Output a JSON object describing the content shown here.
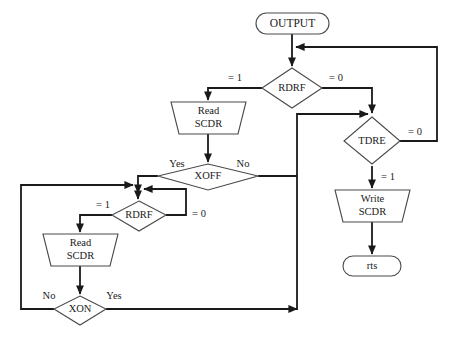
{
  "diagram": {
    "title": "OUTPUT",
    "type": "flowchart",
    "canvas": {
      "width": 452,
      "height": 341
    },
    "colors": {
      "background": "#ffffff",
      "shape_stroke": "#4a4a4a",
      "edge_stroke": "#1a1a1a",
      "text": "#1a1a1a"
    }
  },
  "nodes": {
    "output_terminal": {
      "label": "OUTPUT",
      "shape": "stadium"
    },
    "rdrf_top": {
      "label": "RDRF",
      "shape": "diamond"
    },
    "read_scdr_top": {
      "label_line1": "Read",
      "label_line2": "SCDR",
      "shape": "trapezoid"
    },
    "xoff": {
      "label": "XOFF",
      "shape": "diamond"
    },
    "rdrf_bottom": {
      "label": "RDRF",
      "shape": "diamond"
    },
    "read_scdr_bottom": {
      "label_line1": "Read",
      "label_line2": "SCDR",
      "shape": "trapezoid"
    },
    "xon": {
      "label": "XON",
      "shape": "diamond"
    },
    "tdre": {
      "label": "TDRE",
      "shape": "diamond"
    },
    "write_scdr": {
      "label_line1": "Write",
      "label_line2": "SCDR",
      "shape": "trapezoid"
    },
    "rts_terminal": {
      "label": "rts",
      "shape": "stadium"
    }
  },
  "edge_labels": {
    "rdrf_top_eq1": "= 1",
    "rdrf_top_eq0": "= 0",
    "xoff_yes": "Yes",
    "xoff_no": "No",
    "rdrf_bottom_eq1": "= 1",
    "rdrf_bottom_eq0": "= 0",
    "xon_no": "No",
    "xon_yes": "Yes",
    "tdre_eq0": "= 0",
    "tdre_eq1": "= 1"
  }
}
